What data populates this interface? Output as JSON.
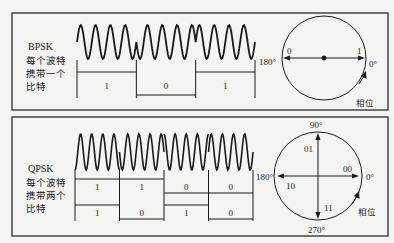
{
  "panels": [
    {
      "id": "bpsk",
      "title": "BPSK",
      "description_lines": [
        "每个波特",
        "携带一个",
        "比特"
      ],
      "bits_per_symbol": 1,
      "cycles_per_symbol": 4,
      "symbols": [
        {
          "bits": [
            "1"
          ],
          "phase_deg": 0
        },
        {
          "bits": [
            "0"
          ],
          "phase_deg": 180
        },
        {
          "bits": [
            "1"
          ],
          "phase_deg": 0
        }
      ],
      "phase_diagram": {
        "axis_labels": {
          "left": "180°",
          "right": "0°"
        },
        "points": [
          {
            "label": "0",
            "angle_deg": 180
          },
          {
            "label": "1",
            "angle_deg": 0
          }
        ],
        "rotation_label": "相位"
      }
    },
    {
      "id": "qpsk",
      "title": "QPSK",
      "description_lines": [
        "每个波特",
        "携带两个",
        "比特"
      ],
      "bits_per_symbol": 2,
      "cycles_per_symbol": 4,
      "symbols": [
        {
          "bits": [
            "1",
            "1"
          ]
        },
        {
          "bits": [
            "1",
            "0"
          ]
        },
        {
          "bits": [
            "0",
            "1"
          ]
        },
        {
          "bits": [
            "0",
            "0"
          ]
        }
      ],
      "phase_diagram": {
        "axis_labels": {
          "top": "90°",
          "left": "180°",
          "right": "0°",
          "bottom": "270°"
        },
        "points": [
          {
            "label": "00",
            "angle_deg": 0
          },
          {
            "label": "01",
            "angle_deg": 90
          },
          {
            "label": "10",
            "angle_deg": 180
          },
          {
            "label": "11",
            "angle_deg": 270
          }
        ],
        "rotation_label": "相位"
      }
    }
  ],
  "colors": {
    "ink": "#1a1a1a",
    "background": "#f4f4f2"
  }
}
